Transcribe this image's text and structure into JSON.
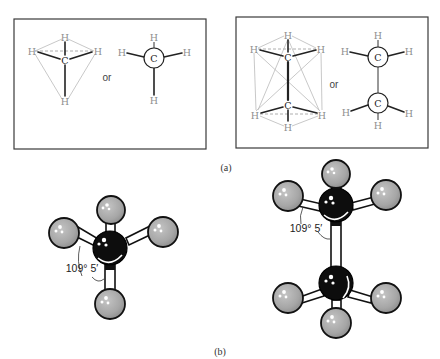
{
  "figure": {
    "part_a": {
      "caption": "(a)",
      "methane": {
        "tetrahedral": {
          "atoms": [
            "H",
            "H",
            "H",
            "C",
            "H"
          ]
        },
        "connector": "or",
        "projection": {
          "atoms": [
            "H",
            "H",
            "H",
            "C",
            "H"
          ]
        }
      },
      "ethane": {
        "tetrahedral": {
          "atoms": [
            "H",
            "H",
            "H",
            "C",
            "C",
            "H",
            "H",
            "H"
          ]
        },
        "connector": "or",
        "projection": {
          "atoms": [
            "H",
            "H",
            "H",
            "C",
            "C",
            "H",
            "H",
            "H"
          ]
        }
      }
    },
    "part_b": {
      "caption": "(b)",
      "methane_model": {
        "angle_label": "109° 5′"
      },
      "ethane_model": {
        "angle_label": "109° 5′"
      }
    }
  },
  "labels": {
    "H": "H",
    "C": "C"
  },
  "colors": {
    "hydrogen_ball": "#a8a8a8",
    "carbon_ball": "#0d0d0d",
    "hydrogen_text": "#8e8e8e",
    "box_stroke": "#3a3a3a"
  }
}
